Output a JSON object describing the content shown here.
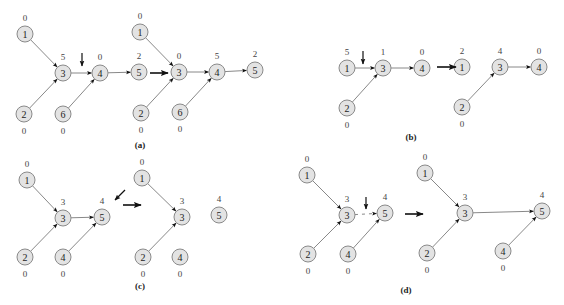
{
  "figure": {
    "panels": [
      {
        "id": "a",
        "caption": "(a)",
        "graphs": [
          {
            "nodes": [
              {
                "id": "1",
                "rank": "0",
                "rank_pos": "above"
              },
              {
                "id": "3",
                "rank": "5",
                "rank_pos": "above"
              },
              {
                "id": "4",
                "rank": "0",
                "rank_pos": "above"
              },
              {
                "id": "5",
                "rank": "2",
                "rank_pos": "above"
              },
              {
                "id": "2",
                "rank": "0",
                "rank_pos": "below"
              },
              {
                "id": "6",
                "rank": "0",
                "rank_pos": "below"
              }
            ],
            "edges": [
              [
                "1",
                "3"
              ],
              [
                "2",
                "3"
              ],
              [
                "3",
                "4"
              ],
              [
                "6",
                "4"
              ],
              [
                "4",
                "5"
              ]
            ],
            "pointer": "edge 3-4"
          },
          {
            "nodes": [
              {
                "id": "1",
                "rank": "0",
                "rank_pos": "above"
              },
              {
                "id": "3",
                "rank": "0",
                "rank_pos": "above"
              },
              {
                "id": "4",
                "rank": "5",
                "rank_pos": "above"
              },
              {
                "id": "5",
                "rank": "2",
                "rank_pos": "above"
              },
              {
                "id": "2",
                "rank": "0",
                "rank_pos": "below"
              },
              {
                "id": "6",
                "rank": "0",
                "rank_pos": "below"
              }
            ],
            "edges": [
              [
                "1",
                "3"
              ],
              [
                "2",
                "3"
              ],
              [
                "3",
                "4"
              ],
              [
                "6",
                "4"
              ],
              [
                "4",
                "5"
              ]
            ]
          }
        ]
      },
      {
        "id": "b",
        "caption": "(b)",
        "graphs": [
          {
            "nodes": [
              {
                "id": "1",
                "rank": "5",
                "rank_pos": "above"
              },
              {
                "id": "3",
                "rank": "1",
                "rank_pos": "above"
              },
              {
                "id": "4",
                "rank": "0",
                "rank_pos": "above"
              },
              {
                "id": "2",
                "rank": "0",
                "rank_pos": "below"
              }
            ],
            "edges": [
              [
                "1",
                "3"
              ],
              [
                "2",
                "3"
              ],
              [
                "3",
                "4"
              ]
            ],
            "pointer": "edge 1-3"
          },
          {
            "nodes": [
              {
                "id": "1",
                "rank": "2",
                "rank_pos": "above"
              },
              {
                "id": "3",
                "rank": "4",
                "rank_pos": "above"
              },
              {
                "id": "4",
                "rank": "0",
                "rank_pos": "above"
              },
              {
                "id": "2",
                "rank": "0",
                "rank_pos": "below"
              }
            ],
            "edges": [
              [
                "2",
                "3"
              ],
              [
                "3",
                "4"
              ]
            ]
          }
        ]
      },
      {
        "id": "c",
        "caption": "(c)",
        "graphs": [
          {
            "nodes": [
              {
                "id": "1",
                "rank": "0",
                "rank_pos": "above"
              },
              {
                "id": "3",
                "rank": "3",
                "rank_pos": "above"
              },
              {
                "id": "5",
                "rank": "4",
                "rank_pos": "above"
              },
              {
                "id": "2",
                "rank": "0",
                "rank_pos": "below"
              },
              {
                "id": "4",
                "rank": "0",
                "rank_pos": "below"
              }
            ],
            "edges": [
              [
                "1",
                "3"
              ],
              [
                "2",
                "3"
              ],
              [
                "3",
                "5"
              ],
              [
                "4",
                "5"
              ]
            ],
            "pointer": "node 5"
          },
          {
            "nodes": [
              {
                "id": "1",
                "rank": "0",
                "rank_pos": "above"
              },
              {
                "id": "3",
                "rank": "3",
                "rank_pos": "above"
              },
              {
                "id": "5",
                "rank": "4",
                "rank_pos": "above"
              },
              {
                "id": "2",
                "rank": "0",
                "rank_pos": "below"
              },
              {
                "id": "4",
                "rank": "0",
                "rank_pos": "below"
              }
            ],
            "edges": [
              [
                "1",
                "3"
              ],
              [
                "2",
                "3"
              ]
            ]
          }
        ]
      },
      {
        "id": "d",
        "caption": "(d)",
        "graphs": [
          {
            "nodes": [
              {
                "id": "1",
                "rank": "0",
                "rank_pos": "above"
              },
              {
                "id": "3",
                "rank": "3",
                "rank_pos": "above"
              },
              {
                "id": "5",
                "rank": "4",
                "rank_pos": "above"
              },
              {
                "id": "2",
                "rank": "0",
                "rank_pos": "below"
              },
              {
                "id": "4",
                "rank": "0",
                "rank_pos": "below"
              }
            ],
            "edges": [
              [
                "1",
                "3"
              ],
              [
                "2",
                "3"
              ],
              [
                "3",
                "5",
                "dashed"
              ],
              [
                "4",
                "5"
              ]
            ],
            "pointer": "edge 3-5"
          },
          {
            "nodes": [
              {
                "id": "1",
                "rank": "0",
                "rank_pos": "above"
              },
              {
                "id": "3",
                "rank": "3",
                "rank_pos": "above"
              },
              {
                "id": "5",
                "rank": "4",
                "rank_pos": "above"
              },
              {
                "id": "2",
                "rank": "0",
                "rank_pos": "below"
              },
              {
                "id": "4",
                "rank": "0",
                "rank_pos": "below"
              }
            ],
            "edges": [
              [
                "1",
                "3"
              ],
              [
                "2",
                "3"
              ],
              [
                "3",
                "5"
              ],
              [
                "4",
                "5"
              ]
            ]
          }
        ]
      }
    ],
    "colors": {
      "node_fill": "#e3e3e3",
      "node_stroke": "#8a8a8a",
      "edge": "#6a6a6a",
      "arrow": "#111111"
    }
  }
}
